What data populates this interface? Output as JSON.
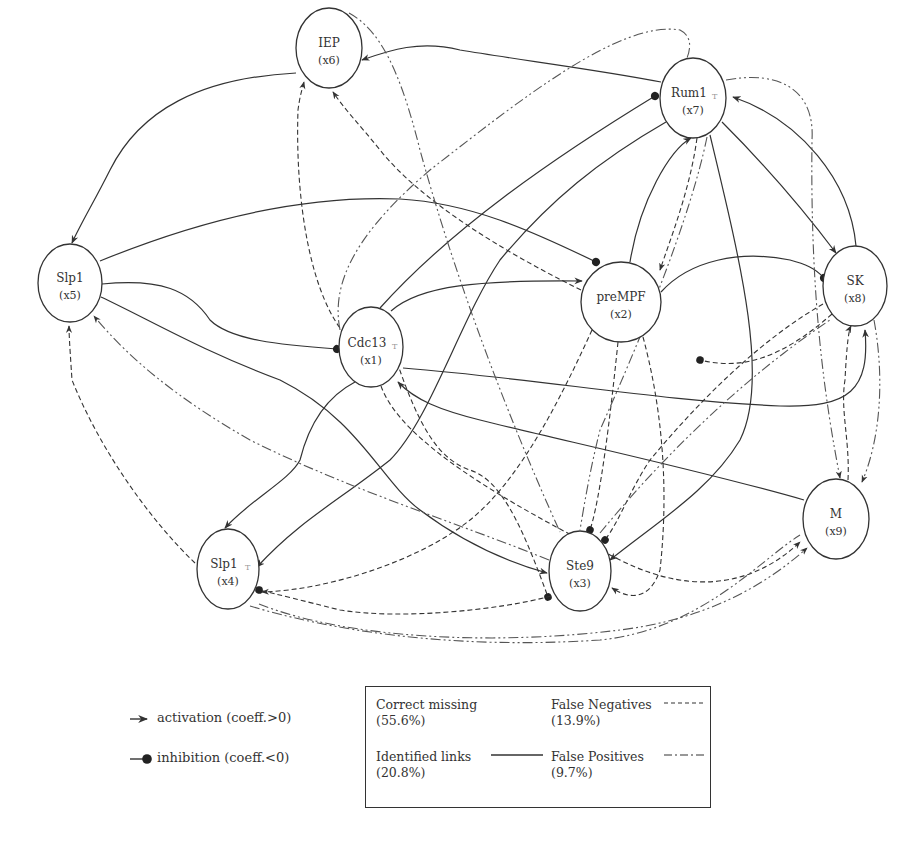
{
  "nodes": [
    {
      "id": "x6",
      "label": "IEP",
      "sub": "(x6)",
      "cx": 329,
      "cy": 48,
      "rx": 33,
      "ry": 40
    },
    {
      "id": "x7",
      "label": "Rum1",
      "sub": "(x7)",
      "superscript": "T",
      "cx": 693,
      "cy": 98,
      "rx": 33,
      "ry": 40
    },
    {
      "id": "x5",
      "label": "Slp1",
      "sub": "(x5)",
      "cx": 70,
      "cy": 283,
      "rx": 32,
      "ry": 39
    },
    {
      "id": "x1",
      "label": "Cdc13",
      "sub": "(x1)",
      "superscript": "T",
      "cx": 371,
      "cy": 347,
      "rx": 32,
      "ry": 40
    },
    {
      "id": "x2",
      "label": "preMPF",
      "sub": "(x2)",
      "cx": 621,
      "cy": 302,
      "rx": 40,
      "ry": 40
    },
    {
      "id": "x8",
      "label": "SK",
      "sub": "(x8)",
      "cx": 855,
      "cy": 286,
      "rx": 32,
      "ry": 40
    },
    {
      "id": "x9",
      "label": "M",
      "sub": "(x9)",
      "cx": 836,
      "cy": 519,
      "rx": 33,
      "ry": 40
    },
    {
      "id": "x4",
      "label": "Slp1",
      "sub": "(x4)",
      "superscript": "T",
      "cx": 228,
      "cy": 569,
      "rx": 31,
      "ry": 40
    },
    {
      "id": "x3",
      "label": "Ste9",
      "sub": "(x3)",
      "cx": 580,
      "cy": 571,
      "rx": 31,
      "ry": 40
    }
  ],
  "edge_types": {
    "identified": "solid",
    "false_negative": "dashed",
    "false_positive": "dash-dot"
  },
  "side_legend": {
    "activation": {
      "symbol": "arrow-icon",
      "text": "activation (coeff.>0)"
    },
    "inhibition": {
      "symbol": "dot-icon",
      "text": "inhibition (coeff.<0)"
    }
  },
  "legend": {
    "correct_missing": {
      "label": "Correct missing",
      "value": "(55.6%)"
    },
    "false_negatives": {
      "label": "False Negatives",
      "value": "(13.9%)",
      "line": "dashed"
    },
    "identified_links": {
      "label": "Identified links",
      "value": "(20.8%)",
      "line": "solid"
    },
    "false_positives": {
      "label": "False Positives",
      "value": "(9.7%)",
      "line": "dash-dot"
    }
  }
}
